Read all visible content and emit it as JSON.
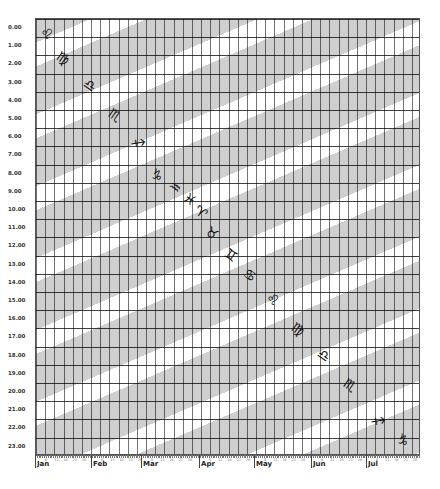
{
  "chart_data": {
    "type": "heatmap",
    "title": "",
    "xlabel": "",
    "ylabel": "",
    "x_months": [
      "Jan",
      "Feb",
      "Mar",
      "Apr",
      "May",
      "Jun",
      "Jul"
    ],
    "x_month_px": [
      37,
      93,
      143,
      201,
      256,
      313,
      368
    ],
    "y_ticks": [
      "0.00",
      "1.00",
      "2.00",
      "3.00",
      "4.00",
      "5.00",
      "6.00",
      "7.00",
      "8.00",
      "9.00",
      "10.00",
      "11.00",
      "12.00",
      "13.00",
      "14.00",
      "15.00",
      "16.00",
      "17.00",
      "18.00",
      "19.00",
      "20.00",
      "21.00",
      "22.00",
      "23.00"
    ],
    "ylim": [
      0,
      24
    ],
    "grid": true,
    "band_colors": {
      "shaded": "#cfcfcf",
      "clear": "#ffffff"
    },
    "zodiac_sequence": [
      {
        "sign": "Leo",
        "glyph": "♌",
        "x": 47,
        "y": 33
      },
      {
        "sign": "Virgo",
        "glyph": "♍",
        "x": 63,
        "y": 58
      },
      {
        "sign": "Libra",
        "glyph": "♎",
        "x": 90,
        "y": 85
      },
      {
        "sign": "Scorpio",
        "glyph": "♏",
        "x": 115,
        "y": 115
      },
      {
        "sign": "Sagittarius",
        "glyph": "♐",
        "x": 138,
        "y": 143
      },
      {
        "sign": "Capricorn",
        "glyph": "♑",
        "x": 157,
        "y": 175
      },
      {
        "sign": "Aquarius",
        "glyph": "♒",
        "x": 175,
        "y": 187
      },
      {
        "sign": "Pisces",
        "glyph": "♓",
        "x": 190,
        "y": 199
      },
      {
        "sign": "Aries",
        "glyph": "♈",
        "x": 201,
        "y": 212
      },
      {
        "sign": "Taurus",
        "glyph": "♉",
        "x": 212,
        "y": 233
      },
      {
        "sign": "Gemini",
        "glyph": "♊",
        "x": 231,
        "y": 255
      },
      {
        "sign": "Cancer",
        "glyph": "♋",
        "x": 250,
        "y": 275
      },
      {
        "sign": "Leo",
        "glyph": "♌",
        "x": 273,
        "y": 299
      },
      {
        "sign": "Virgo",
        "glyph": "♍",
        "x": 298,
        "y": 329
      },
      {
        "sign": "Libra",
        "glyph": "♎",
        "x": 324,
        "y": 355
      },
      {
        "sign": "Scorpio",
        "glyph": "♏",
        "x": 350,
        "y": 385
      },
      {
        "sign": "Sagittarius",
        "glyph": "♐",
        "x": 378,
        "y": 421
      },
      {
        "sign": "Capricorn",
        "glyph": "♑",
        "x": 403,
        "y": 440
      }
    ]
  }
}
